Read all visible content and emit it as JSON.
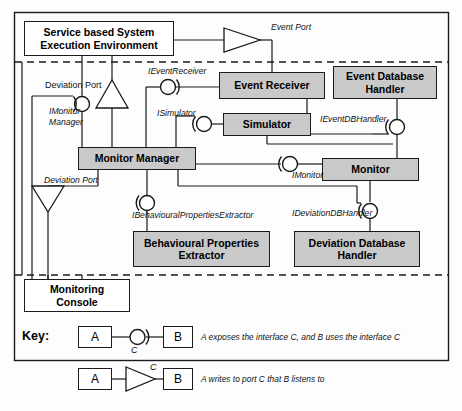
{
  "diagram": {
    "outer_border": true,
    "components": [
      {
        "id": "service_env",
        "label": "Service based System\nExecution Environment",
        "line1": "Service based System",
        "line2": "Execution Environment",
        "fill": "#ffffff",
        "x": 24,
        "y": 21,
        "w": 150,
        "h": 35
      },
      {
        "id": "event_receiver",
        "label": "Event Receiver",
        "line1": "Event Receiver",
        "line2": "",
        "fill": "#c9c9c9",
        "x": 219,
        "y": 72,
        "w": 106,
        "h": 27
      },
      {
        "id": "event_db_handler",
        "label": "Event Database Handler",
        "line1": "Event Database",
        "line2": "Handler",
        "fill": "#c9c9c9",
        "x": 333,
        "y": 66,
        "w": 104,
        "h": 33
      },
      {
        "id": "simulator",
        "label": "Simulator",
        "line1": "Simulator",
        "line2": "",
        "fill": "#c9c9c9",
        "x": 223,
        "y": 113,
        "w": 88,
        "h": 23
      },
      {
        "id": "monitor_manager",
        "label": "Monitor Manager",
        "line1": "Monitor Manager",
        "line2": "",
        "fill": "#c9c9c9",
        "x": 78,
        "y": 147,
        "w": 118,
        "h": 23
      },
      {
        "id": "monitor",
        "label": "Monitor",
        "line1": "Monitor",
        "line2": "",
        "fill": "#c9c9c9",
        "x": 322,
        "y": 158,
        "w": 97,
        "h": 23
      },
      {
        "id": "behavioural_props_extractor",
        "label": "Behavioural Properties Extractor",
        "line1": "Behavioural Properties",
        "line2": "Extractor",
        "fill": "#c9c9c9",
        "x": 133,
        "y": 231,
        "w": 137,
        "h": 36
      },
      {
        "id": "deviation_db_handler",
        "label": "Deviation Database Handler",
        "line1": "Deviation Database",
        "line2": "Handler",
        "fill": "#c9c9c9",
        "x": 294,
        "y": 231,
        "w": 126,
        "h": 36
      },
      {
        "id": "monitoring_console",
        "label": "Monitoring Console",
        "line1": "Monitoring",
        "line2": "Console",
        "fill": "#ffffff",
        "x": 24,
        "y": 279,
        "w": 106,
        "h": 33
      }
    ],
    "annotations": [
      {
        "id": "event_port",
        "text": "Event Port",
        "x": 271,
        "y": 22,
        "italic": true
      },
      {
        "id": "deviation_port_top",
        "text": "Deviation Port",
        "x": 45,
        "y": 82,
        "italic": false
      },
      {
        "id": "ievent_receiver",
        "text": "IEventReceiver",
        "x": 148,
        "y": 68,
        "italic": true
      },
      {
        "id": "imonitor_manager_l1",
        "text": "IMonitor",
        "x": 49,
        "y": 108,
        "italic": true
      },
      {
        "id": "imonitor_manager_l2",
        "text": "Manager",
        "x": 49,
        "y": 118,
        "italic": true
      },
      {
        "id": "isimulator",
        "text": "ISimulator",
        "x": 157,
        "y": 110,
        "italic": true
      },
      {
        "id": "ievent_db_handler",
        "text": "IEventDBHandler",
        "x": 325,
        "y": 116,
        "italic": true
      },
      {
        "id": "imonitor",
        "text": "IMonitor",
        "x": 288,
        "y": 173,
        "italic": true
      },
      {
        "id": "deviation_port_bottom",
        "text": "Deviation Port",
        "x": 44,
        "y": 177,
        "italic": true
      },
      {
        "id": "ibehavioural_props_extractor",
        "text": "IBehaviouralPropertiesExtractor",
        "x": 132,
        "y": 212,
        "italic": true
      },
      {
        "id": "ideviation_db_handler",
        "text": "IDeviationDBHandler",
        "x": 297,
        "y": 210,
        "italic": true
      }
    ],
    "key": {
      "title": "Key:",
      "rows": [
        {
          "id": "key-row-interface",
          "left_box": "A",
          "right_box": "B",
          "connector_label": "C",
          "connector_type": "ball-socket",
          "description": "A exposes the interface C, and B uses the interface C"
        },
        {
          "id": "key-row-port",
          "left_box": "A",
          "right_box": "B",
          "connector_label": "C",
          "connector_type": "triangle-port",
          "description": "A writes to port C that B listens to"
        }
      ]
    },
    "colors": {
      "component_fill": "#c9c9c9",
      "plain_fill": "#ffffff",
      "stroke": "#1a1a1a",
      "background": "#fdfdfd"
    }
  }
}
